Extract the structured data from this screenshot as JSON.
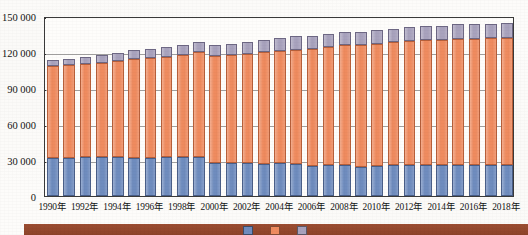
{
  "chart_data": {
    "type": "bar",
    "subtype": "stacked-column",
    "title": "",
    "xlabel": "",
    "ylabel": "",
    "ylim": [
      0,
      150000
    ],
    "ytick_values": [
      0,
      30000,
      60000,
      90000,
      120000,
      150000
    ],
    "ytick_labels": [
      "0",
      "30 000",
      "60 000",
      "90 000",
      "120 000",
      "150 000"
    ],
    "grid": true,
    "legend_position": "bottom",
    "categories": [
      "1990年",
      "1991年",
      "1992年",
      "1993年",
      "1994年",
      "1995年",
      "1996年",
      "1997年",
      "1998年",
      "1999年",
      "2000年",
      "2001年",
      "2002年",
      "2003年",
      "2004年",
      "2005年",
      "2006年",
      "2007年",
      "2008年",
      "2009年",
      "2010年",
      "2011年",
      "2012年",
      "2013年",
      "2014年",
      "2015年",
      "2016年",
      "2017年",
      "2018年"
    ],
    "xtick_labels": [
      "1990年",
      "1992年",
      "1994年",
      "1996年",
      "1998年",
      "2000年",
      "2002年",
      "2004年",
      "2006年",
      "2008年",
      "2010年",
      "2012年",
      "2014年",
      "2016年",
      "2018年"
    ],
    "series": [
      {
        "name": "series-1",
        "color": "#6f8cbe",
        "values": [
          31500,
          32000,
          32500,
          32500,
          32500,
          32000,
          32000,
          32500,
          32500,
          32500,
          27500,
          27500,
          27500,
          26500,
          27500,
          26500,
          25000,
          25500,
          26000,
          24500,
          25000,
          25500,
          25500,
          25500,
          25500,
          25500,
          25500,
          25500,
          25500
        ]
      },
      {
        "name": "series-2",
        "color": "#ef8b5f",
        "values": [
          76500,
          77000,
          77500,
          78500,
          80000,
          82500,
          83000,
          83500,
          85000,
          87500,
          89000,
          90000,
          91000,
          93500,
          93500,
          95500,
          97500,
          98500,
          99500,
          101500,
          102000,
          102500,
          103500,
          104500,
          104500,
          105500,
          105500,
          106000,
          106500
        ]
      },
      {
        "name": "series-3",
        "color": "#a8a2bd",
        "values": [
          5500,
          5500,
          6000,
          6500,
          6500,
          7000,
          7500,
          8000,
          8500,
          8500,
          9000,
          9500,
          9500,
          10000,
          10500,
          11000,
          11000,
          11000,
          11000,
          11000,
          11500,
          11500,
          11500,
          11500,
          12000,
          12000,
          12000,
          12000,
          12000
        ]
      }
    ],
    "totals": [
      113500,
      114500,
      116000,
      117500,
      119000,
      121500,
      122500,
      124000,
      126000,
      128500,
      125500,
      127000,
      128000,
      130000,
      131500,
      133000,
      133500,
      135000,
      136500,
      137000,
      138500,
      139500,
      140500,
      141500,
      142000,
      143000,
      143000,
      143500,
      144000
    ]
  },
  "footer": {
    "legend": [
      {
        "label": "",
        "color": "#6f8cbe"
      },
      {
        "label": "",
        "color": "#ef8b5f"
      },
      {
        "label": "",
        "color": "#a8a2bd"
      }
    ],
    "strip_color": "#9c4e33"
  }
}
